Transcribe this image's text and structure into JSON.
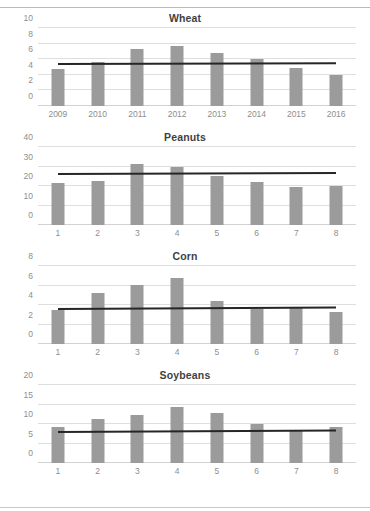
{
  "colors": {
    "bar": "#9b9b9b",
    "trend_line": "#262626",
    "gridline": "#dedede",
    "tick_text": "#8e8e8e",
    "title_text": "#3f3f3f",
    "background": "#ffffff"
  },
  "chart_data": [
    {
      "type": "bar",
      "title": "Wheat",
      "xlabel": "",
      "ylabel": "",
      "ylim": [
        0,
        10
      ],
      "yticks": [
        0,
        2,
        4,
        6,
        8,
        10
      ],
      "grid": true,
      "legend": "none",
      "categories": [
        "2009",
        "2010",
        "2011",
        "2012",
        "2013",
        "2014",
        "2015",
        "2016"
      ],
      "values": [
        4.8,
        5.6,
        7.3,
        7.7,
        6.8,
        6.0,
        4.9,
        4.0
      ],
      "trendline": {
        "label": "trend",
        "y_start": 5.5,
        "y_end": 5.6
      }
    },
    {
      "type": "bar",
      "title": "Peanuts",
      "xlabel": "",
      "ylabel": "",
      "ylim": [
        0,
        40
      ],
      "yticks": [
        0,
        10,
        20,
        30,
        40
      ],
      "grid": true,
      "legend": "none",
      "categories": [
        "1",
        "2",
        "3",
        "4",
        "5",
        "6",
        "7",
        "8"
      ],
      "values": [
        21.5,
        22.5,
        31.5,
        30.0,
        25.0,
        22.0,
        19.5,
        20.0
      ],
      "trendline": {
        "label": "trend",
        "y_start": 26.5,
        "y_end": 27.0
      }
    },
    {
      "type": "bar",
      "title": "Corn",
      "xlabel": "",
      "ylabel": "",
      "ylim": [
        0,
        8
      ],
      "yticks": [
        0,
        2,
        4,
        6,
        8
      ],
      "grid": true,
      "legend": "none",
      "categories": [
        "1",
        "2",
        "3",
        "4",
        "5",
        "6",
        "7",
        "8"
      ],
      "values": [
        3.5,
        5.2,
        6.1,
        6.8,
        4.4,
        3.6,
        3.8,
        3.3
      ],
      "trendline": {
        "label": "trend",
        "y_start": 3.7,
        "y_end": 3.85
      }
    },
    {
      "type": "bar",
      "title": "Soybeans",
      "xlabel": "",
      "ylabel": "",
      "ylim": [
        0,
        20
      ],
      "yticks": [
        0,
        5,
        10,
        15,
        20
      ],
      "grid": true,
      "legend": "none",
      "categories": [
        "1",
        "2",
        "3",
        "4",
        "5",
        "6",
        "7",
        "8"
      ],
      "values": [
        9.3,
        11.2,
        12.4,
        14.4,
        12.9,
        10.0,
        8.2,
        9.3
      ],
      "trendline": {
        "label": "trend",
        "y_start": 8.2,
        "y_end": 8.6
      }
    }
  ]
}
